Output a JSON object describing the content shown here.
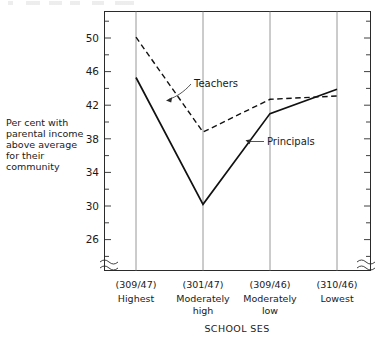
{
  "chart_data": {
    "type": "line",
    "title": "",
    "xlabel": "SCHOOL SES",
    "ylabel": "Per cent with parental income above average for their community",
    "categories": [
      "Highest",
      "Moderately high",
      "Moderately low",
      "Lowest"
    ],
    "category_counts": [
      "(309/47)",
      "(301/47)",
      "(309/46)",
      "(310/46)"
    ],
    "ylim": [
      24,
      52
    ],
    "yticks": [
      26,
      30,
      34,
      38,
      42,
      46,
      50
    ],
    "minor_ticks": true,
    "grid": "vertical-category-lines",
    "y_axis_break": true,
    "x_axis_break": true,
    "legend": "inline-annotations",
    "series": [
      {
        "name": "Teachers",
        "style": "dashed",
        "values": [
          50.1,
          38.8,
          42.7,
          43.1
        ]
      },
      {
        "name": "Principals",
        "style": "solid",
        "values": [
          45.3,
          30.2,
          41.0,
          43.9
        ]
      }
    ]
  },
  "axis": {
    "y_tick_labels": [
      "50",
      "46",
      "42",
      "38",
      "34",
      "30",
      "26"
    ],
    "x_title": "SCHOOL SES",
    "y_title_lines": [
      "Per cent with",
      "parental income",
      "above average",
      "for their",
      "community"
    ],
    "x_categories": [
      {
        "count": "(309/47)",
        "name_line1": "Highest",
        "name_line2": ""
      },
      {
        "count": "(301/47)",
        "name_line1": "Moderately",
        "name_line2": "high"
      },
      {
        "count": "(309/46)",
        "name_line1": "Moderately",
        "name_line2": "low"
      },
      {
        "count": "(310/46)",
        "name_line1": "Lowest",
        "name_line2": ""
      }
    ]
  },
  "annotations": {
    "teachers_label": "Teachers",
    "principals_label": "Principals"
  },
  "colors": {
    "line": "#111111",
    "frame": "#2b2b2b",
    "gridline": "#8d8d8d",
    "background": "#ffffff",
    "text": "#1a1a1a"
  }
}
